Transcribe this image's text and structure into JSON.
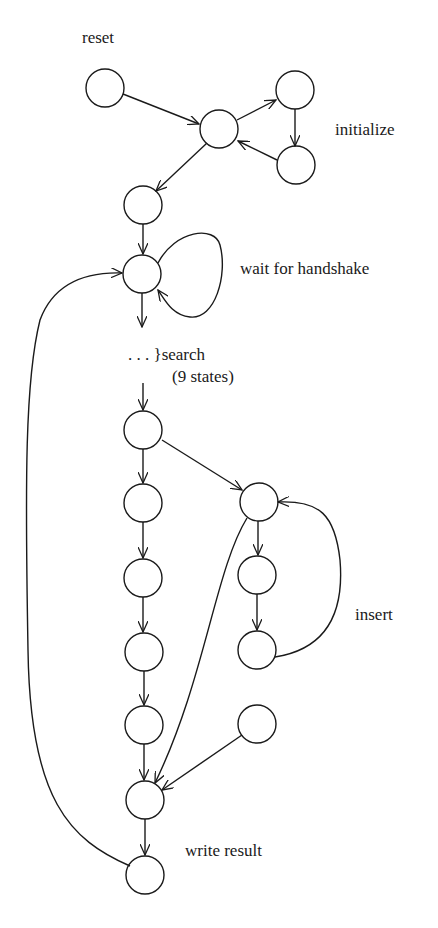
{
  "diagram": {
    "type": "state-machine",
    "colors": {
      "background": "#ffffff",
      "stroke": "#1a1a1a"
    },
    "labels": {
      "reset": "reset",
      "initialize": "initialize",
      "wait": "wait for handshake",
      "search_dots": ". . . }search",
      "search_count": "(9 states)",
      "insert": "insert",
      "write": "write result"
    },
    "nodes": [
      {
        "id": "reset",
        "x": 105,
        "y": 88
      },
      {
        "id": "init_hub",
        "x": 219,
        "y": 129
      },
      {
        "id": "init_a",
        "x": 295,
        "y": 90
      },
      {
        "id": "init_b",
        "x": 296,
        "y": 165
      },
      {
        "id": "pre_wait",
        "x": 143,
        "y": 205
      },
      {
        "id": "wait",
        "x": 142,
        "y": 274
      },
      {
        "id": "s1",
        "x": 143,
        "y": 430
      },
      {
        "id": "l1",
        "x": 143,
        "y": 503
      },
      {
        "id": "l2",
        "x": 143,
        "y": 578
      },
      {
        "id": "l3",
        "x": 144,
        "y": 652
      },
      {
        "id": "l4",
        "x": 144,
        "y": 725
      },
      {
        "id": "r1",
        "x": 259,
        "y": 502
      },
      {
        "id": "r2",
        "x": 257,
        "y": 575
      },
      {
        "id": "r3",
        "x": 257,
        "y": 650
      },
      {
        "id": "r4",
        "x": 257,
        "y": 724
      },
      {
        "id": "merge",
        "x": 145,
        "y": 800
      },
      {
        "id": "write",
        "x": 145,
        "y": 875
      }
    ]
  }
}
